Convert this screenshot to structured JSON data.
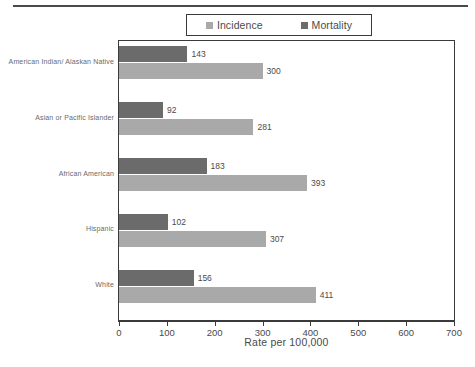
{
  "chart_data": {
    "type": "bar",
    "orientation": "horizontal",
    "title": "",
    "xlabel": "Rate per 100,000",
    "ylabel": "",
    "xlim": [
      0,
      700
    ],
    "xticks": [
      0,
      100,
      200,
      300,
      400,
      500,
      600,
      700
    ],
    "xtick_labels": [
      "0",
      "100",
      "200",
      "300",
      "400",
      "500",
      "600",
      "700"
    ],
    "grid": false,
    "legend_position": "top-center",
    "categories": [
      "American Indian/ Alaskan Native",
      "Asian or Pacific Islander",
      "African American",
      "Hispanic",
      "White"
    ],
    "series": [
      {
        "name": "Mortality",
        "color": "#6b6b6b",
        "values": [
          143,
          92,
          183,
          102,
          156
        ],
        "value_labels": [
          "143",
          "92",
          "183",
          "102",
          "156"
        ]
      },
      {
        "name": "Incidence",
        "color": "#a9a9a9",
        "values": [
          300,
          281,
          393,
          307,
          411
        ],
        "value_labels": [
          "300",
          "281",
          "393",
          "307",
          "411"
        ]
      }
    ]
  },
  "legend": {
    "entries": [
      {
        "label": "Incidence",
        "color": "#a9a9a9",
        "swatch": "square-swatch-icon"
      },
      {
        "label": "Mortality",
        "color": "#6b6b6b",
        "swatch": "square-swatch-icon"
      }
    ]
  },
  "axis": {
    "x_title": "Rate per 100,000"
  },
  "colors": {
    "incidence": "#a9a9a9",
    "mortality": "#6b6b6b",
    "axis_line": "#3a3a3a",
    "text": "#4a4a4a",
    "category_text": "#6a6a6a",
    "rule": "#4a4a4a",
    "background": "#ffffff"
  }
}
